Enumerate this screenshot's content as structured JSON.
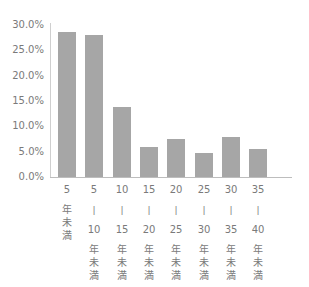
{
  "chart_data": {
    "type": "bar",
    "title": "",
    "xlabel": "",
    "ylabel": "",
    "ylim": [
      0,
      30
    ],
    "grid": false,
    "legend": null,
    "y_ticks": [
      "0.0%",
      "5.0%",
      "10.0%",
      "15.0%",
      "20.0%",
      "25.0%",
      "30.0%"
    ],
    "categories": [
      "5年未満",
      "5-10年未満",
      "10-15年未満",
      "15-20年未満",
      "20-25年未満",
      "25-30年未満",
      "30-35年未満",
      "35-40年未満"
    ],
    "category_labels": [
      [
        "5",
        "年",
        "未",
        "満"
      ],
      [
        "5",
        "|",
        "10",
        "年",
        "未",
        "満"
      ],
      [
        "10",
        "|",
        "15",
        "年",
        "未",
        "満"
      ],
      [
        "15",
        "|",
        "20",
        "年",
        "未",
        "満"
      ],
      [
        "20",
        "|",
        "25",
        "年",
        "未",
        "満"
      ],
      [
        "25",
        "|",
        "30",
        "年",
        "未",
        "満"
      ],
      [
        "30",
        "|",
        "35",
        "年",
        "未",
        "満"
      ],
      [
        "35",
        "|",
        "40",
        "年",
        "未",
        "満"
      ]
    ],
    "values": [
      28.6,
      28.0,
      13.8,
      5.9,
      7.5,
      4.7,
      7.9,
      5.5
    ],
    "unit": "%"
  },
  "colors": {
    "bar": "#a6a6a6",
    "axis": "#bdbdbd",
    "text": "#7a7a7a"
  }
}
